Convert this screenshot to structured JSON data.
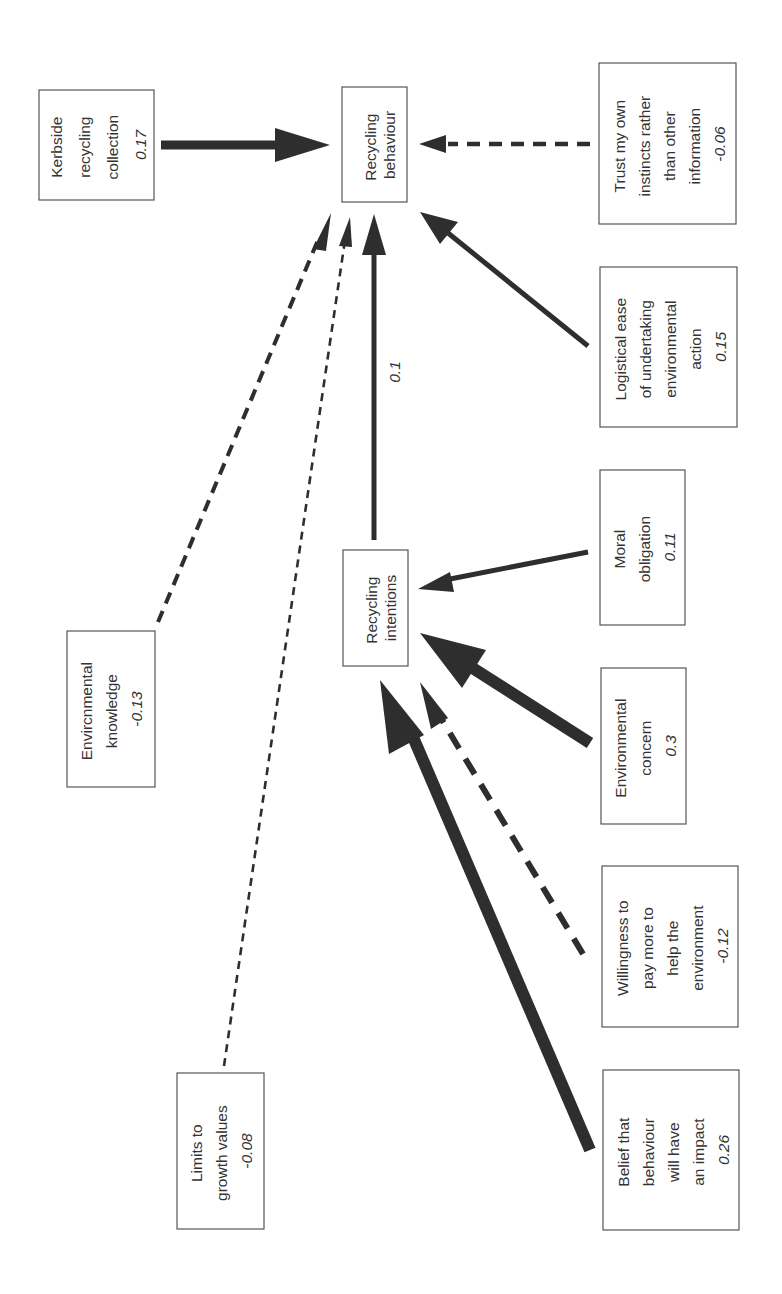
{
  "diagram": {
    "type": "path-diagram",
    "orientation": "rotated-90-ccw",
    "nodes": {
      "recycling_behaviour": {
        "lines": [
          "Recycling",
          "behaviour"
        ],
        "coef": ""
      },
      "recycling_intentions": {
        "lines": [
          "Recycling",
          "intentions"
        ],
        "coef": ""
      },
      "kerbside": {
        "lines": [
          "Kerbside",
          "recycling",
          "collection"
        ],
        "coef": "0.17"
      },
      "trust": {
        "lines": [
          "Trust my own",
          "instincts rather",
          "than other",
          "information"
        ],
        "coef": "-0.06"
      },
      "logistical": {
        "lines": [
          "Logistical ease",
          "of undertaking",
          "environmental",
          "action"
        ],
        "coef": "0.15"
      },
      "moral": {
        "lines": [
          "Moral",
          "obligation"
        ],
        "coef": "0.11"
      },
      "concern": {
        "lines": [
          "Environmental",
          "concern"
        ],
        "coef": "0.3"
      },
      "willingness": {
        "lines": [
          "Willingness to",
          "pay more to",
          "help the",
          "environment"
        ],
        "coef": "-0.12"
      },
      "belief": {
        "lines": [
          "Belief that",
          "behaviour",
          "will have",
          "an impact"
        ],
        "coef": "0.26"
      },
      "knowledge": {
        "lines": [
          "Envircnmental",
          "knowledge"
        ],
        "coef": "-0.13"
      },
      "limits": {
        "lines": [
          "Limits to",
          "growth values"
        ],
        "coef": "-0.08"
      }
    },
    "edges": [
      {
        "from": "kerbside",
        "to": "recycling_behaviour",
        "weight": 0.17,
        "style": "solid"
      },
      {
        "from": "trust",
        "to": "recycling_behaviour",
        "weight": -0.06,
        "style": "dashed"
      },
      {
        "from": "logistical",
        "to": "recycling_behaviour",
        "weight": 0.15,
        "style": "solid"
      },
      {
        "from": "recycling_intentions",
        "to": "recycling_behaviour",
        "weight": 0.1,
        "style": "solid",
        "label": "0.1"
      },
      {
        "from": "knowledge",
        "to": "recycling_behaviour",
        "weight": -0.13,
        "style": "dashed"
      },
      {
        "from": "limits",
        "to": "recycling_behaviour",
        "weight": -0.08,
        "style": "dashed"
      },
      {
        "from": "moral",
        "to": "recycling_intentions",
        "weight": 0.11,
        "style": "solid"
      },
      {
        "from": "concern",
        "to": "recycling_intentions",
        "weight": 0.3,
        "style": "solid"
      },
      {
        "from": "willingness",
        "to": "recycling_intentions",
        "weight": -0.12,
        "style": "dashed"
      },
      {
        "from": "belief",
        "to": "recycling_intentions",
        "weight": 0.26,
        "style": "solid"
      }
    ],
    "edge_label_intentions_behaviour": "0.1"
  }
}
